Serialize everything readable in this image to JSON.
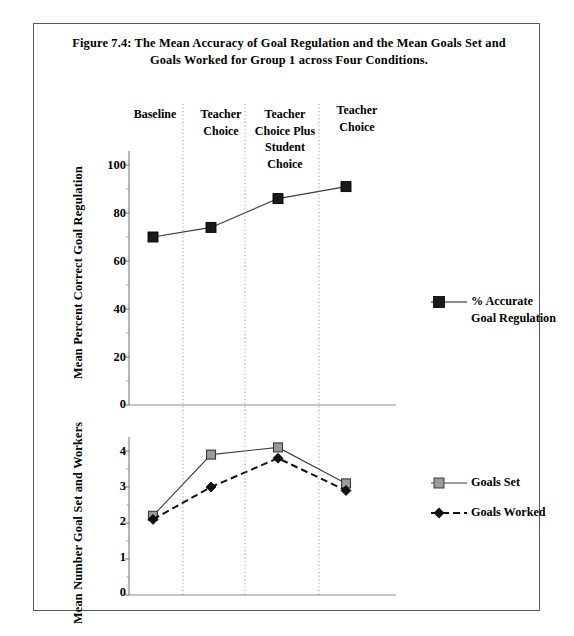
{
  "figure": {
    "title": "Figure 7.4: The Mean Accuracy of Goal Regulation and the Mean Goals Set and Goals Worked for Group 1 across Four Conditions."
  },
  "conditions": [
    {
      "label": "Baseline"
    },
    {
      "label": "Teacher Choice"
    },
    {
      "label": "Teacher Choice Plus Student Choice"
    },
    {
      "label": "Teacher Choice"
    }
  ],
  "top_panel": {
    "axis_title": "Mean Percent Correct Goal Regulation",
    "ticks": [
      "100",
      "80",
      "60",
      "40",
      "20",
      "0"
    ],
    "legend": {
      "series_name_line1": "% Accurate",
      "series_name_line2": "Goal Regulation"
    }
  },
  "bottom_panel": {
    "axis_title": "Mean Number Goal Set and Workers",
    "ticks": [
      "4",
      "3",
      "2",
      "1",
      "0"
    ],
    "legend": [
      {
        "label": "Goals Set"
      },
      {
        "label": "Goals Worked"
      }
    ]
  },
  "colors": {
    "marker_accurate": "#1a1a1a",
    "marker_goals_set": "#9a9a9a",
    "marker_goals_worked": "#111111",
    "line": "#3c3c3c",
    "frame": "#5a5a5a",
    "gridline": "#b4b4b4"
  },
  "chart_data": [
    {
      "type": "line",
      "title": "Mean Accuracy of Goal Regulation (Group 1)",
      "xlabel": "",
      "ylabel": "Mean Percent Correct Goal Regulation",
      "categories": [
        "Baseline",
        "Teacher Choice",
        "Teacher Choice Plus Student Choice",
        "Teacher Choice"
      ],
      "ylim": [
        0,
        100
      ],
      "yticks": [
        0,
        20,
        40,
        60,
        80,
        100
      ],
      "grid": false,
      "legend_position": "right",
      "series": [
        {
          "name": "% Accurate Goal Regulation",
          "values": [
            70,
            74,
            86,
            91
          ],
          "marker": "filled-square",
          "linestyle": "solid",
          "color": "#1a1a1a"
        }
      ]
    },
    {
      "type": "line",
      "title": "Mean Goals Set and Goals Worked (Group 1)",
      "xlabel": "",
      "ylabel": "Mean Number Goal Set and Workers",
      "categories": [
        "Baseline",
        "Teacher Choice",
        "Teacher Choice Plus Student Choice",
        "Teacher Choice"
      ],
      "ylim": [
        0,
        4
      ],
      "yticks": [
        0,
        1,
        2,
        3,
        4
      ],
      "grid": false,
      "legend_position": "right",
      "series": [
        {
          "name": "Goals Set",
          "values": [
            2.2,
            3.9,
            4.1,
            3.1
          ],
          "marker": "open-square",
          "linestyle": "solid",
          "color": "#9a9a9a"
        },
        {
          "name": "Goals Worked",
          "values": [
            2.1,
            3.0,
            3.8,
            2.9
          ],
          "marker": "filled-diamond",
          "linestyle": "dashed",
          "color": "#111111"
        }
      ]
    }
  ]
}
